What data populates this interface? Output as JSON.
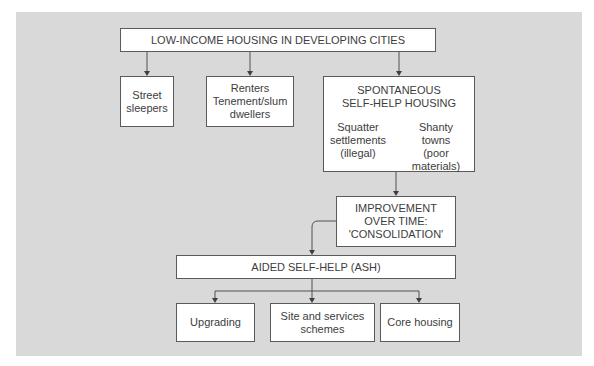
{
  "diagram": {
    "root": {
      "label": "LOW-INCOME HOUSING IN DEVELOPING CITIES"
    },
    "level1": [
      {
        "id": "street",
        "label": "Street\nsleepers"
      },
      {
        "id": "renters",
        "label": "Renters\nTenement/slum\ndwellers"
      },
      {
        "id": "spontaneous",
        "label": "SPONTANEOUS\nSELF-HELP HOUSING",
        "children": [
          {
            "label": "Squatter\nsettlements\n(illegal)"
          },
          {
            "label": "Shanty\ntowns\n(poor materials)"
          }
        ]
      }
    ],
    "improvement": {
      "label": "IMPROVEMENT\nOVER TIME:\n'CONSOLIDATION'"
    },
    "ash": {
      "label": "AIDED SELF-HELP (ASH)"
    },
    "ash_children": [
      {
        "label": "Upgrading"
      },
      {
        "label": "Site and services\nschemes"
      },
      {
        "label": "Core housing"
      }
    ]
  }
}
